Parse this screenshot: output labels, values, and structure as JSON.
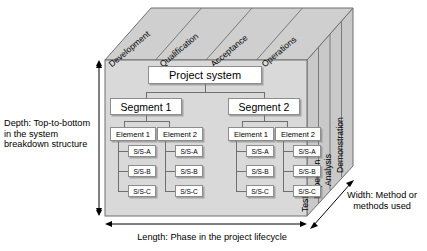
{
  "diagram": {
    "colors": {
      "front_face": "#d9d9d9",
      "top_face": "#cfcfcf",
      "side_face": "#c9c9c9",
      "outline": "#6f6f6f",
      "box_fill": "#ffffff",
      "box_border": "#8d8d8d",
      "text": "#000000"
    }
  },
  "axes": {
    "depth_label": "Depth: Top-to-bottom in the system breakdown structure",
    "width_label": "Width: Method or methods used",
    "length_label": "Length: Phase in the project lifecycle"
  },
  "top_face": {
    "caption": "Phases along the project lifecycle",
    "phases": [
      {
        "label": "Development"
      },
      {
        "label": "Qualification"
      },
      {
        "label": "Acceptance"
      },
      {
        "label": "Operations"
      }
    ]
  },
  "side_face": {
    "caption": "Verification methods",
    "methods": [
      {
        "label": "Test"
      },
      {
        "label": "Inspection"
      },
      {
        "label": "Analysis"
      },
      {
        "label": "Demonstration"
      }
    ]
  },
  "tree": {
    "root": {
      "label": "Project system"
    },
    "segments": [
      {
        "label": "Segment 1",
        "elements": [
          {
            "label": "Element 1",
            "subsystems": [
              {
                "label": "S/S-A"
              },
              {
                "label": "S/S-B"
              },
              {
                "label": "S/S-C"
              }
            ]
          },
          {
            "label": "Element 2",
            "subsystems": [
              {
                "label": "S/S-A"
              },
              {
                "label": "S/S-B"
              },
              {
                "label": "S/S-C"
              }
            ]
          }
        ]
      },
      {
        "label": "Segment 2",
        "elements": [
          {
            "label": "Element 1",
            "subsystems": [
              {
                "label": "S/S-A"
              },
              {
                "label": "S/S-B"
              },
              {
                "label": "S/S-C"
              }
            ]
          },
          {
            "label": "Element 2",
            "subsystems": [
              {
                "label": "S/S-A"
              },
              {
                "label": "S/S-B"
              },
              {
                "label": "S/S-C"
              }
            ]
          }
        ]
      }
    ]
  }
}
